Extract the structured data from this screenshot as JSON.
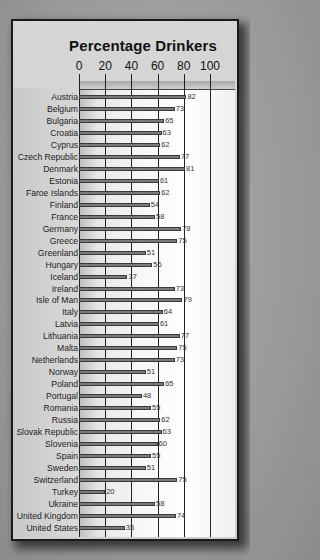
{
  "chart_data": {
    "type": "bar",
    "orientation": "horizontal",
    "title": "Percentage Drinkers",
    "xlabel": "",
    "ylabel": "",
    "xlim": [
      0,
      100
    ],
    "x_ticks": [
      0,
      20,
      40,
      60,
      80,
      100
    ],
    "grid": true,
    "legend": null,
    "categories": [
      "Austria",
      "Belgium",
      "Bulgaria",
      "Croatia",
      "Cyprus",
      "Czech Republic",
      "Denmark",
      "Estonia",
      "Faroe Islands",
      "Finland",
      "France",
      "Germany",
      "Greece",
      "Greenland",
      "Hungary",
      "Iceland",
      "Ireland",
      "Isle of Man",
      "Italy",
      "Latvia",
      "Lithuania",
      "Malta",
      "Netherlands",
      "Norway",
      "Poland",
      "Portugal",
      "Romania",
      "Russia",
      "Slovak Republic",
      "Slovenia",
      "Spain",
      "Sweden",
      "Switzerland",
      "Turkey",
      "Ukraine",
      "United Kingdom",
      "United States"
    ],
    "values": [
      82,
      73,
      65,
      63,
      62,
      77,
      81,
      61,
      62,
      54,
      58,
      78,
      75,
      51,
      56,
      37,
      73,
      79,
      64,
      61,
      77,
      75,
      73,
      51,
      65,
      48,
      55,
      62,
      63,
      60,
      55,
      51,
      75,
      20,
      58,
      74,
      35
    ]
  },
  "colors": {
    "bar_fill": "#7a7a7a",
    "bar_border": "#3a3a3a",
    "gridline": "#222222",
    "frame": "#1a1a1a",
    "background": "#9a9a9a"
  }
}
